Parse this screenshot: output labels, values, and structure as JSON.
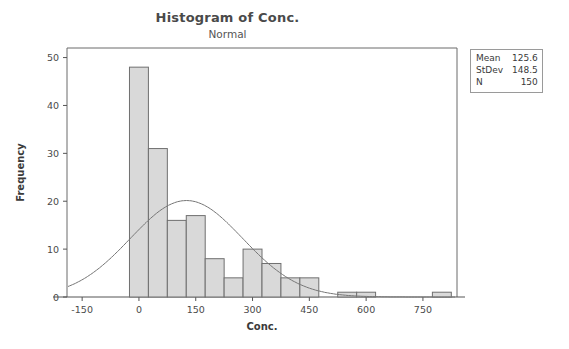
{
  "header": {
    "title": "Histogram of Conc.",
    "subtitle": "Normal"
  },
  "stats": {
    "rows": [
      {
        "label": "Mean",
        "value": "125.6"
      },
      {
        "label": "StDev",
        "value": "148.5"
      },
      {
        "label": "N",
        "value": "150"
      }
    ]
  },
  "colors": {
    "bar_fill": "#d9d9d9",
    "bar_stroke": "#6f6f6f",
    "curve": "#777777",
    "frame": "#6b6b6b",
    "text": "#3a3a3a"
  },
  "chart_data": {
    "type": "bar",
    "title": "Histogram of Conc.",
    "subtitle": "Normal",
    "xlabel": "Conc.",
    "ylabel": "Frequency",
    "xlim": [
      -190,
      840
    ],
    "ylim": [
      0,
      52
    ],
    "xticks": [
      -150,
      0,
      150,
      300,
      450,
      600,
      750
    ],
    "yticks": [
      0,
      10,
      20,
      30,
      40,
      50
    ],
    "grid": false,
    "legend": false,
    "bin_width": 50,
    "bin_starts": [
      -25,
      25,
      75,
      125,
      175,
      225,
      275,
      325,
      375,
      425,
      525,
      575,
      775
    ],
    "values": [
      48,
      31,
      16,
      17,
      8,
      4,
      10,
      7,
      4,
      4,
      1,
      1,
      1
    ],
    "overlay": {
      "type": "line",
      "name": "Normal",
      "mean": 125.6,
      "stdev": 148.5,
      "n": 150,
      "peak_frequency": 20.5
    }
  }
}
